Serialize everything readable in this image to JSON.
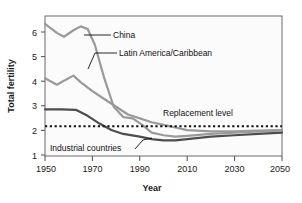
{
  "chart_data": {
    "type": "line",
    "title": "",
    "xlabel": "Year",
    "ylabel": "Total fertility",
    "xlim": [
      1950,
      2050
    ],
    "ylim": [
      1,
      6.4
    ],
    "xticks": [
      1950,
      1970,
      1990,
      2010,
      2030,
      2050
    ],
    "yticks": [
      1,
      2,
      3,
      4,
      5,
      6
    ],
    "grid": false,
    "legend": "inline-annotations",
    "annotations": [
      {
        "name": "China",
        "text": "China",
        "leader": "horizontal"
      },
      {
        "name": "Latin America/Caribbean",
        "text": "Latin America/Caribbean",
        "leader": "elbow"
      },
      {
        "name": "Replacement level",
        "text": "Replacement level",
        "leader": "none"
      },
      {
        "name": "Industrial countries",
        "text": "Industrial countries",
        "leader": "diagonal"
      }
    ],
    "series": [
      {
        "name": "China",
        "color": "#9a9a9a",
        "x": [
          1950,
          1955,
          1958,
          1962,
          1965,
          1968,
          1971,
          1975,
          1979,
          1983,
          1987,
          1991,
          1995,
          2000,
          2005,
          2010,
          2020,
          2030,
          2040,
          2050
        ],
        "values": [
          6.1,
          5.75,
          5.6,
          5.85,
          6.0,
          5.9,
          5.3,
          4.0,
          2.9,
          2.5,
          2.45,
          2.2,
          1.9,
          1.8,
          1.75,
          1.78,
          1.85,
          1.9,
          1.95,
          2.0
        ]
      },
      {
        "name": "Latin America/Caribbean",
        "color": "#9a9a9a",
        "x": [
          1950,
          1955,
          1958,
          1962,
          1965,
          1970,
          1975,
          1980,
          1985,
          1990,
          1995,
          2000,
          2005,
          2010,
          2020,
          2030,
          2040,
          2050
        ],
        "values": [
          4.0,
          3.75,
          3.9,
          4.1,
          3.85,
          3.5,
          3.2,
          2.9,
          2.6,
          2.45,
          2.3,
          2.2,
          2.1,
          2.0,
          1.95,
          1.95,
          1.98,
          2.0
        ]
      },
      {
        "name": "Industrial countries",
        "color": "#4d4d4d",
        "x": [
          1950,
          1957,
          1963,
          1968,
          1973,
          1978,
          1983,
          1990,
          1995,
          2000,
          2005,
          2010,
          2020,
          2030,
          2040,
          2050
        ],
        "values": [
          2.8,
          2.8,
          2.78,
          2.55,
          2.25,
          2.0,
          1.85,
          1.75,
          1.65,
          1.6,
          1.6,
          1.65,
          1.75,
          1.8,
          1.85,
          1.9
        ]
      }
    ],
    "reference_line": {
      "name": "Replacement level",
      "value": 2.15,
      "style": "dotted",
      "color": "#111111"
    }
  }
}
